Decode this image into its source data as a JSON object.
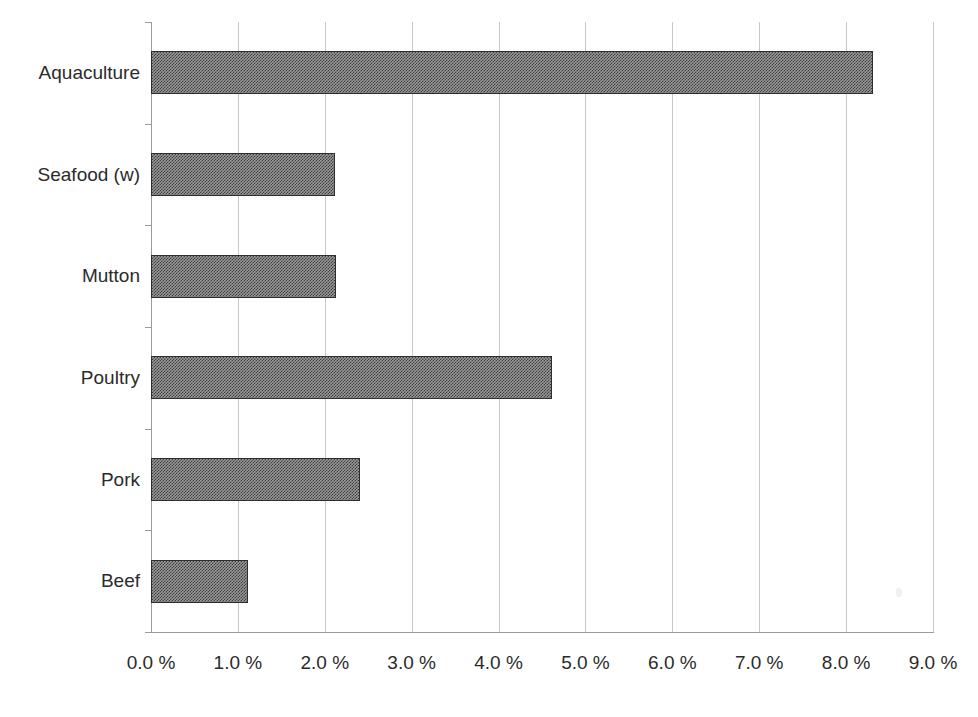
{
  "chart_data": {
    "type": "bar",
    "orientation": "horizontal",
    "title": "",
    "subtitle": "",
    "xlabel": "",
    "ylabel": "",
    "categories": [
      "Beef",
      "Pork",
      "Poultry",
      "Mutton",
      "Seafood (w)",
      "Aquaculture"
    ],
    "values": [
      1.12,
      2.41,
      4.61,
      2.13,
      2.12,
      8.31
    ],
    "series": [
      {
        "name": "",
        "values": [
          1.12,
          2.41,
          4.61,
          2.13,
          2.12,
          8.31
        ]
      }
    ],
    "display_order_top_to_bottom": [
      "Aquaculture",
      "Seafood (w)",
      "Mutton",
      "Poultry",
      "Pork",
      "Beef"
    ],
    "xlim": [
      0.0,
      9.0
    ],
    "x_tick_values": [
      0.0,
      1.0,
      2.0,
      3.0,
      4.0,
      5.0,
      6.0,
      7.0,
      8.0,
      9.0
    ],
    "x_tick_labels": [
      "0.0 %",
      "1.0 %",
      "2.0 %",
      "3.0 %",
      "4.0 %",
      "5.0 %",
      "6.0 %",
      "7.0 %",
      "8.0 %",
      "9.0 %"
    ],
    "x_unit": "%",
    "grid": true,
    "grid_axis": "x",
    "legend": false,
    "legend_position": "none",
    "annotations": [],
    "colors": {
      "bar_fill": "#9a9a9a",
      "bar_border": "#2e2e2e",
      "gridline": "#c9c9c9",
      "axis_line": "#9b9b9b",
      "text": "#2b2b2b",
      "background": "#ffffff"
    }
  },
  "bars": [
    {
      "label": "Aquaculture",
      "value": 8.31
    },
    {
      "label": "Seafood (w)",
      "value": 2.12
    },
    {
      "label": "Mutton",
      "value": 2.13
    },
    {
      "label": "Poultry",
      "value": 4.61
    },
    {
      "label": "Pork",
      "value": 2.41
    },
    {
      "label": "Beef",
      "value": 1.12
    }
  ],
  "x_axis": {
    "ticks": [
      {
        "label": "0.0 %",
        "value": 0.0
      },
      {
        "label": "1.0 %",
        "value": 1.0
      },
      {
        "label": "2.0 %",
        "value": 2.0
      },
      {
        "label": "3.0 %",
        "value": 3.0
      },
      {
        "label": "4.0 %",
        "value": 4.0
      },
      {
        "label": "5.0 %",
        "value": 5.0
      },
      {
        "label": "6.0 %",
        "value": 6.0
      },
      {
        "label": "7.0 %",
        "value": 7.0
      },
      {
        "label": "8.0 %",
        "value": 8.0
      },
      {
        "label": "9.0 %",
        "value": 9.0
      }
    ],
    "min": 0.0,
    "max": 9.0
  }
}
